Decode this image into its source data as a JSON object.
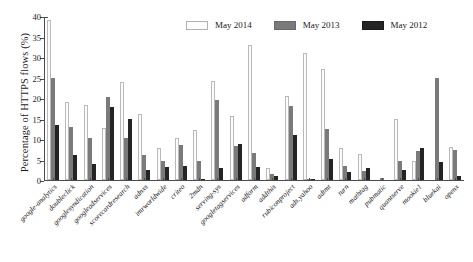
{
  "chart_data": {
    "type": "bar",
    "title": "",
    "xlabel": "",
    "ylabel": "Percentage of HTTPS flows (%)",
    "ylim": [
      0,
      40
    ],
    "yticks": [
      0,
      5,
      10,
      15,
      20,
      25,
      30,
      35,
      40
    ],
    "grid": false,
    "legend_position": "top-right",
    "categories": [
      "google-analytics",
      "doubleclick",
      "googlesyndication",
      "googleadservices",
      "scorecardresearch",
      "adnxs",
      "imrworldwide",
      "criteo",
      "2mdn",
      "serving-sys",
      "googletagservices",
      "adform",
      "addthis",
      "rubiconproject",
      "ads.yahoo",
      "adtmt",
      "turn",
      "mathtag",
      "pubmatic",
      "quantserve",
      "mookie1",
      "bluekai",
      "openx"
    ],
    "series": [
      {
        "name": "May 2014",
        "color": "#fcfcfc",
        "values": [
          39.0,
          19.0,
          18.2,
          12.7,
          23.8,
          16.1,
          7.9,
          10.3,
          12.2,
          24.2,
          15.6,
          32.9,
          2.9,
          20.5,
          31.0,
          27.0,
          7.9,
          6.4,
          0.0,
          15.0,
          4.6,
          0.0,
          8.0
        ]
      },
      {
        "name": "May 2013",
        "color": "#7a7a7a",
        "values": [
          24.9,
          13.0,
          10.3,
          20.3,
          10.2,
          6.1,
          4.7,
          8.6,
          4.6,
          19.4,
          8.2,
          6.5,
          1.4,
          18.1,
          0.2,
          12.4,
          3.4,
          2.2,
          0.5,
          4.7,
          7.1,
          25.0,
          7.2
        ]
      },
      {
        "name": "May 2012",
        "color": "#242424",
        "values": [
          13.4,
          6.2,
          3.9,
          17.8,
          14.8,
          2.5,
          3.2,
          3.5,
          0.3,
          2.9,
          8.9,
          3.1,
          1.0,
          10.9,
          0.2,
          5.1,
          1.9,
          2.9,
          0.0,
          2.4,
          7.8,
          4.5,
          1.0
        ]
      }
    ]
  },
  "legend": {
    "items": [
      {
        "label": "May 2014"
      },
      {
        "label": "May 2013"
      },
      {
        "label": "May 2012"
      }
    ]
  }
}
